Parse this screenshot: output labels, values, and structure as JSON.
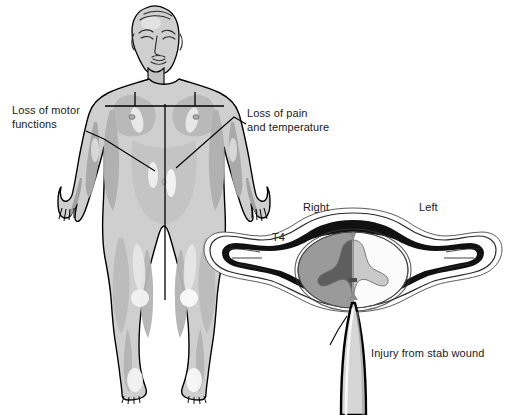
{
  "figure": {
    "background_color": "#ffffff"
  },
  "annotations": {
    "loss_of_motor": "Loss of motor\nfunctions",
    "loss_of_pain": "Loss of pain\nand temperature",
    "side_right": "Right",
    "side_left": "Left",
    "vertebral_level": "T4",
    "injury": "Injury from stab wound"
  },
  "body_figure": {
    "name": "anterior-human-body-diagram",
    "outline_color": "#000000",
    "skin_fill": "#cfcfcf",
    "shadow_fill": "#a8a8a8",
    "highlight_fill": "#ededed",
    "midline_color": "#000000",
    "sensory_level_line": "T4 dermatome level across chest"
  },
  "cross_section": {
    "name": "t4-vertebra-spinal-cord-cross-section",
    "vertebra_outline_color": "#000000",
    "vertebra_fill": "#ffffff",
    "bone_shadow_fill": "#111111",
    "cord_white_matter_right": "#9a9a9a",
    "cord_white_matter_left": "#ffffff",
    "gray_matter_right": "#6e6e6e",
    "gray_matter_left": "#c8c8c8",
    "blade_fill": "#d6d6d6",
    "blade_outline": "#000000"
  },
  "colors": {
    "text": "#1a1a1a",
    "line": "#000000",
    "page_background": "#ffffff"
  }
}
